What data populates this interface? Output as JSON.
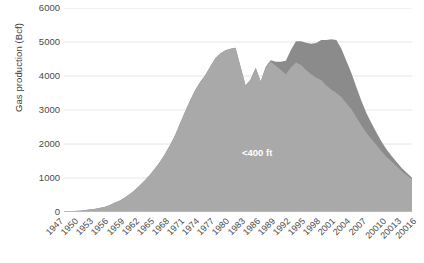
{
  "chart_data": {
    "type": "area",
    "title": "",
    "subtitle": "",
    "xlabel": "",
    "ylabel": "Gas production (Bcf)",
    "ylim": [
      0,
      6000
    ],
    "ytick_values": [
      0,
      1000,
      2000,
      3000,
      4000,
      5000,
      6000
    ],
    "ytick_labels": [
      "0",
      "1000",
      "2000",
      "3000",
      "4000",
      "5000",
      "6000"
    ],
    "grid": "horizontal",
    "legend_position": "inline-annotations",
    "stacked": true,
    "xtick_labels": [
      "1947",
      "1950",
      "1953",
      "1956",
      "1959",
      "1962",
      "1965",
      "1968",
      "1971",
      "1974",
      "1977",
      "1980",
      "1983",
      "1986",
      "1989",
      "1992",
      "1995",
      "1998",
      "2001",
      "2004",
      "2007",
      "20010",
      "20013",
      "20016"
    ],
    "x": [
      1947,
      1948,
      1949,
      1950,
      1951,
      1952,
      1953,
      1954,
      1955,
      1956,
      1957,
      1958,
      1959,
      1960,
      1961,
      1962,
      1963,
      1964,
      1965,
      1966,
      1967,
      1968,
      1969,
      1970,
      1971,
      1972,
      1973,
      1974,
      1975,
      1976,
      1977,
      1978,
      1979,
      1980,
      1981,
      1982,
      1983,
      1984,
      1985,
      1986,
      1987,
      1988,
      1989,
      1990,
      1991,
      1992,
      1993,
      1994,
      1995,
      1996,
      1997,
      1998,
      1999,
      2000,
      2001,
      2002,
      2003,
      2004,
      2005,
      2006,
      2007,
      2008,
      2009,
      2010,
      2011,
      2012,
      2013,
      2014,
      2015,
      2016
    ],
    "series": [
      {
        "name": "<400 ft",
        "color": "#a9a9a9",
        "label_text": "<400 ft",
        "values": [
          20,
          25,
          30,
          40,
          55,
          70,
          90,
          115,
          150,
          200,
          270,
          330,
          420,
          520,
          640,
          780,
          930,
          1090,
          1270,
          1470,
          1700,
          1960,
          2250,
          2600,
          2950,
          3280,
          3580,
          3820,
          4020,
          4280,
          4520,
          4660,
          4760,
          4800,
          4830,
          4280,
          3720,
          3900,
          4240,
          3840,
          4250,
          4420,
          4300,
          4180,
          4050,
          4250,
          4400,
          4320,
          4180,
          4050,
          3950,
          3880,
          3720,
          3600,
          3500,
          3380,
          3200,
          3020,
          2780,
          2540,
          2320,
          2140,
          1960,
          1780,
          1620,
          1480,
          1340,
          1200,
          1080,
          960
        ]
      },
      {
        "name": ">400 ft",
        "color": "#8b8b8b",
        "label_text": ">400 ft",
        "values": [
          0,
          0,
          0,
          0,
          0,
          0,
          0,
          0,
          0,
          0,
          0,
          0,
          0,
          0,
          0,
          0,
          0,
          0,
          0,
          0,
          0,
          0,
          0,
          0,
          0,
          0,
          0,
          0,
          0,
          0,
          0,
          0,
          0,
          0,
          0,
          0,
          0,
          0,
          0,
          0,
          20,
          40,
          120,
          240,
          400,
          520,
          620,
          700,
          800,
          900,
          1020,
          1180,
          1340,
          1480,
          1560,
          1420,
          1240,
          1060,
          880,
          720,
          580,
          460,
          360,
          280,
          210,
          160,
          120,
          90,
          70,
          50
        ]
      }
    ]
  }
}
